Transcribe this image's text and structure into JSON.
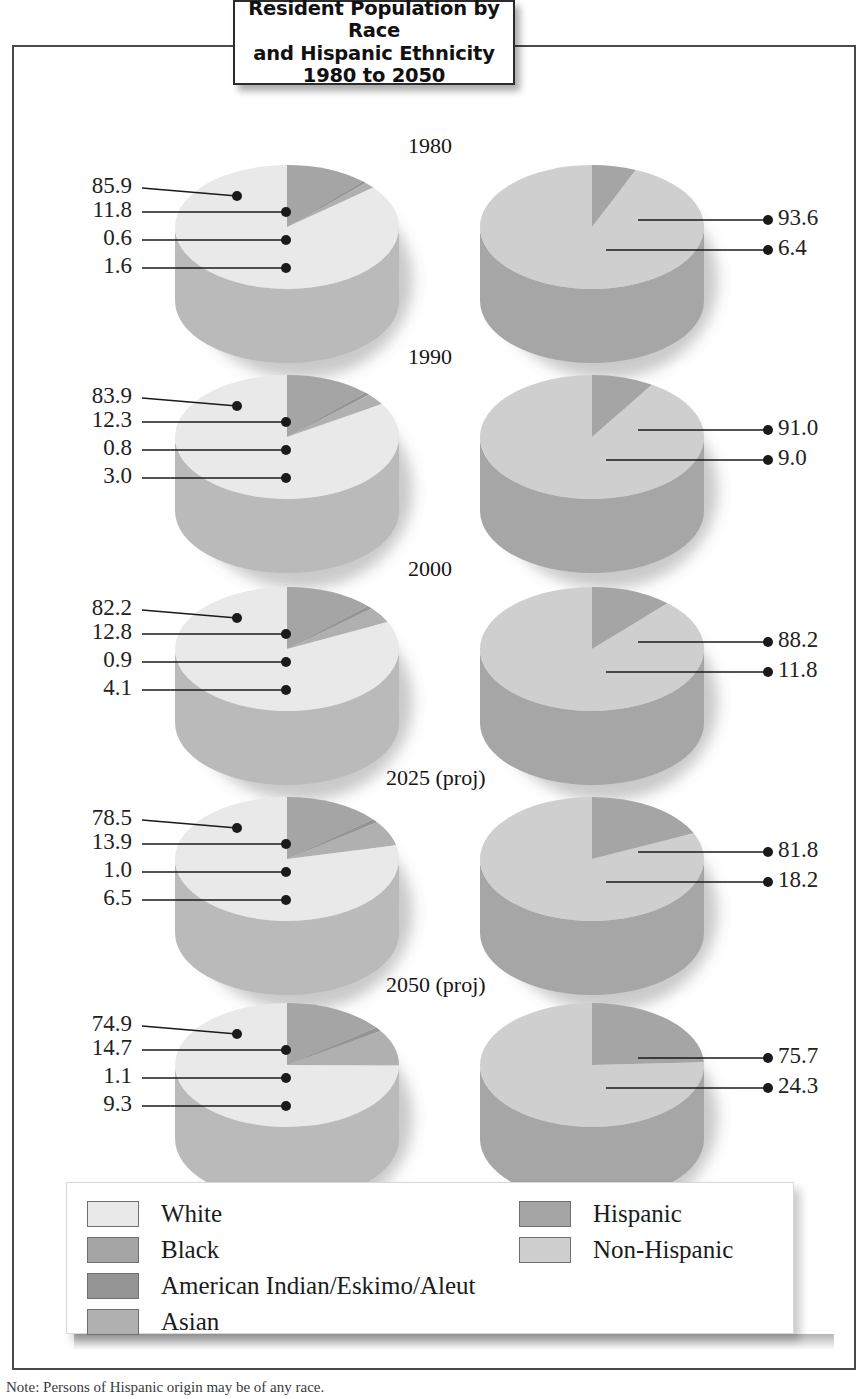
{
  "title": {
    "line1": "Resident Population by Race",
    "line2": "and Hispanic Ethnicity",
    "line3": "1980 to 2050"
  },
  "years": [
    {
      "label": "1980"
    },
    {
      "label": "1990"
    },
    {
      "label": "2000"
    },
    {
      "label": "2025 (proj)"
    },
    {
      "label": "2050 (proj)"
    }
  ],
  "race_labels": {
    "y1980": [
      "85.9",
      "11.8",
      "0.6",
      "1.6"
    ],
    "y1990": [
      "83.9",
      "12.3",
      "0.8",
      "3.0"
    ],
    "y2000": [
      "82.2",
      "12.8",
      "0.9",
      "4.1"
    ],
    "y2025": [
      "78.5",
      "13.9",
      "1.0",
      "6.5"
    ],
    "y2050": [
      "74.9",
      "14.7",
      "1.1",
      "9.3"
    ]
  },
  "ethnicity_labels": {
    "y1980": [
      "93.6",
      "6.4"
    ],
    "y1990": [
      "91.0",
      "9.0"
    ],
    "y2000": [
      "88.2",
      "11.8"
    ],
    "y2025": [
      "81.8",
      "18.2"
    ],
    "y2050": [
      "75.7",
      "24.3"
    ]
  },
  "legend": {
    "left": [
      {
        "label": "White",
        "color": "#e9e9e9"
      },
      {
        "label": "Black",
        "color": "#a5a5a5"
      },
      {
        "label": "American Indian/Eskimo/Aleut",
        "color": "#959595"
      },
      {
        "label": "Asian",
        "color": "#b0b0b0"
      }
    ],
    "right": [
      {
        "label": "Hispanic",
        "color": "#a5a5a5"
      },
      {
        "label": "Non-Hispanic",
        "color": "#cfcfcf"
      }
    ]
  },
  "note": "Note: Persons of Hispanic origin may be of any race.",
  "colors": {
    "white_race": "#e9e9e9",
    "black_race": "#a5a5a5",
    "amind_race": "#959595",
    "asian_race": "#b0b0b0",
    "hispanic": "#a5a5a5",
    "non_hispanic": "#cfcfcf",
    "frame": "#4a4a4a",
    "leader": "#1a1a1a"
  },
  "chart_data": {
    "type": "pie",
    "title": "Resident Population by Race and Hispanic Ethnicity 1980 to 2050",
    "xlabel": "",
    "ylabel": "",
    "legend_position": "bottom",
    "grid": false,
    "units": "percent of resident population",
    "panels": [
      {
        "year": "1980",
        "column": "left",
        "categories": [
          "White",
          "Black",
          "American Indian/Eskimo/Aleut",
          "Asian"
        ],
        "values": [
          85.9,
          11.8,
          0.6,
          1.6
        ]
      },
      {
        "year": "1980",
        "column": "right",
        "categories": [
          "Non-Hispanic",
          "Hispanic"
        ],
        "values": [
          93.6,
          6.4
        ]
      },
      {
        "year": "1990",
        "column": "left",
        "categories": [
          "White",
          "Black",
          "American Indian/Eskimo/Aleut",
          "Asian"
        ],
        "values": [
          83.9,
          12.3,
          0.8,
          3.0
        ]
      },
      {
        "year": "1990",
        "column": "right",
        "categories": [
          "Non-Hispanic",
          "Hispanic"
        ],
        "values": [
          91.0,
          9.0
        ]
      },
      {
        "year": "2000",
        "column": "left",
        "categories": [
          "White",
          "Black",
          "American Indian/Eskimo/Aleut",
          "Asian"
        ],
        "values": [
          82.2,
          12.8,
          0.9,
          4.1
        ]
      },
      {
        "year": "2000",
        "column": "right",
        "categories": [
          "Non-Hispanic",
          "Hispanic"
        ],
        "values": [
          88.2,
          11.8
        ]
      },
      {
        "year": "2025 (proj)",
        "column": "left",
        "categories": [
          "White",
          "Black",
          "American Indian/Eskimo/Aleut",
          "Asian"
        ],
        "values": [
          78.5,
          13.9,
          1.0,
          6.5
        ]
      },
      {
        "year": "2025 (proj)",
        "column": "right",
        "categories": [
          "Non-Hispanic",
          "Hispanic"
        ],
        "values": [
          81.8,
          18.2
        ]
      },
      {
        "year": "2050 (proj)",
        "column": "left",
        "categories": [
          "White",
          "Black",
          "American Indian/Eskimo/Aleut",
          "Asian"
        ],
        "values": [
          74.9,
          14.7,
          1.1,
          9.3
        ]
      },
      {
        "year": "2050 (proj)",
        "column": "right",
        "categories": [
          "Non-Hispanic",
          "Hispanic"
        ],
        "values": [
          75.7,
          24.3
        ]
      }
    ]
  }
}
